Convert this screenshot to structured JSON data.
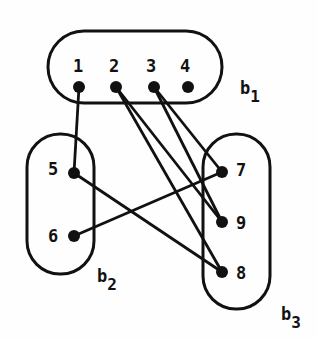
{
  "groups": [
    {
      "id": "b1",
      "label": "b",
      "sub": "1"
    },
    {
      "id": "b2",
      "label": "b",
      "sub": "2"
    },
    {
      "id": "b3",
      "label": "b",
      "sub": "3"
    }
  ],
  "vertices": [
    {
      "id": "1",
      "label": "1"
    },
    {
      "id": "2",
      "label": "2"
    },
    {
      "id": "3",
      "label": "3"
    },
    {
      "id": "4",
      "label": "4"
    },
    {
      "id": "5",
      "label": "5"
    },
    {
      "id": "6",
      "label": "6"
    },
    {
      "id": "7",
      "label": "7"
    },
    {
      "id": "9",
      "label": "9"
    },
    {
      "id": "8",
      "label": "8"
    }
  ],
  "edges": [
    [
      "1",
      "5"
    ],
    [
      "2",
      "9"
    ],
    [
      "2",
      "8"
    ],
    [
      "3",
      "7"
    ],
    [
      "3",
      "9"
    ],
    [
      "5",
      "8"
    ],
    [
      "6",
      "7"
    ]
  ]
}
